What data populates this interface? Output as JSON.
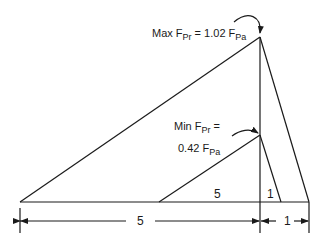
{
  "diagram": {
    "max_label": {
      "prefix": "Max F",
      "sub1": "Pr",
      "mid": " = 1.02 F",
      "sub2": "Pa"
    },
    "min_label": {
      "line1_prefix": "Min F",
      "line1_sub": "Pr",
      "line1_suffix": " =",
      "line2_prefix": "0.42 F",
      "line2_sub": "Pa"
    },
    "inner_labels": {
      "small_base": "5",
      "small_right": "1"
    },
    "dimensions": {
      "left_span": "5",
      "right_span": "1"
    },
    "colors": {
      "stroke": "#1a1a1a",
      "background": "#ffffff"
    }
  }
}
